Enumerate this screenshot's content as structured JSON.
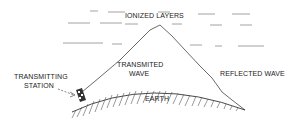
{
  "diagram": {
    "labels": {
      "ionized_layers": "IONIZED LAYERS",
      "transmitted_wave_1": "TRANSMITED",
      "transmitted_wave_2": "WAVE",
      "reflected_wave": "REFLECTED WAVE",
      "transmitting_station_1": "TRANSMITTING",
      "transmitting_station_2": "STATION",
      "earth": "EARTH"
    },
    "colors": {
      "line": "#333333",
      "dash": "#888888",
      "background": "#ffffff"
    }
  }
}
